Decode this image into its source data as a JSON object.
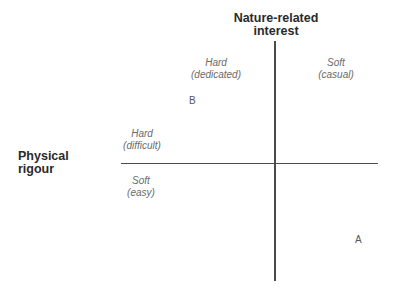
{
  "axes": {
    "vertical": {
      "title_line1": "Nature-related",
      "title_line2": "interest"
    },
    "horizontal": {
      "title_line1": "Physical",
      "title_line2": "rigour"
    }
  },
  "quadrant_labels": {
    "top_left": {
      "line1": "Hard",
      "line2": "(dedicated)"
    },
    "top_right": {
      "line1": "Soft",
      "line2": "(casual)"
    },
    "left_upper": {
      "line1": "Hard",
      "line2": "(difficult)"
    },
    "left_lower": {
      "line1": "Soft",
      "line2": "(easy)"
    }
  },
  "points": [
    {
      "label": "B"
    },
    {
      "label": "A"
    }
  ],
  "colors": {
    "axis": "#4a4a4a",
    "title": "#2a2a2a",
    "label": "#6a6a6a"
  }
}
